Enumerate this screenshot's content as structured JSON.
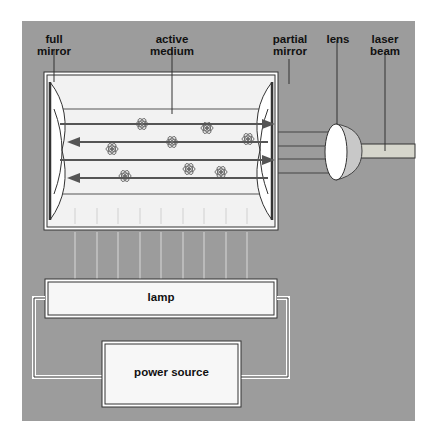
{
  "diagram": {
    "labels": {
      "full_mirror": "full\nmirror",
      "active_medium": "active\nmedium",
      "partial_mirror": "partial\nmirror",
      "lens": "lens",
      "laser_beam": "laser\nbeam",
      "lamp": "lamp",
      "power_source": "power source"
    },
    "colors": {
      "background": "#9c9c9c",
      "panel_fill": "#f2f2f2",
      "box_fill": "#f7f7f7",
      "stroke": "#333333",
      "arrow": "#555555",
      "beam": "#d6d6cc"
    },
    "components": [
      "full mirror",
      "active medium",
      "partial mirror",
      "lens",
      "laser beam",
      "lamp",
      "power source"
    ]
  }
}
